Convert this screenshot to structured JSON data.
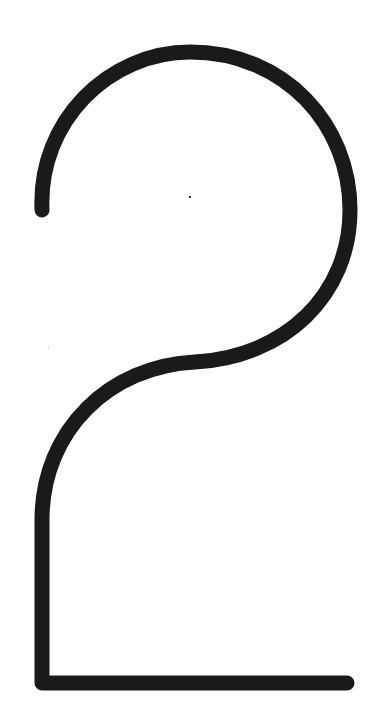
{
  "figure": {
    "glyph": "2",
    "stroke_color": "#1a1a1a",
    "background_color": "#ffffff",
    "stroke_width": 15
  }
}
